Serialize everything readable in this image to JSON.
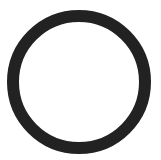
{
  "shape": {
    "type": "ring",
    "center": [
      79,
      82
    ],
    "outer_radius": 72,
    "stroke_width": 12,
    "stroke_color": "#222222",
    "fill_color": "#ffffff",
    "background": "#ffffff"
  }
}
